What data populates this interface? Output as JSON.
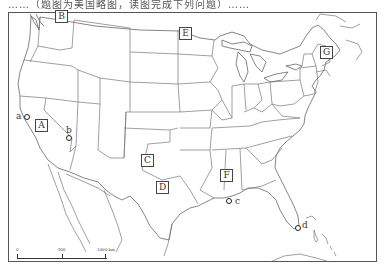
{
  "caption": {
    "text": "……（题图为美国略图，读图完成下列问题）……"
  },
  "map": {
    "title": "United States outline map (contiguous states)",
    "region_labels": [
      {
        "id": "A",
        "label": "A",
        "x": 35,
        "y": 119
      },
      {
        "id": "B",
        "label": "B",
        "x": 55,
        "y": 10
      },
      {
        "id": "C",
        "label": "C",
        "x": 141,
        "y": 154
      },
      {
        "id": "D",
        "label": "D",
        "x": 156,
        "y": 181
      },
      {
        "id": "E",
        "label": "E",
        "x": 179,
        "y": 27
      },
      {
        "id": "F",
        "label": "F",
        "x": 220,
        "y": 169
      },
      {
        "id": "G",
        "label": "G",
        "x": 320,
        "y": 46
      }
    ],
    "points": [
      {
        "id": "a",
        "label": "a",
        "x": 24,
        "y": 114,
        "lx": 16,
        "ly": 112
      },
      {
        "id": "b",
        "label": "b",
        "x": 66,
        "y": 135,
        "lx": 66,
        "ly": 126
      },
      {
        "id": "c",
        "label": "c",
        "x": 226,
        "y": 198,
        "lx": 235,
        "ly": 197
      },
      {
        "id": "d",
        "label": "d",
        "x": 295,
        "y": 225,
        "lx": 302,
        "ly": 221
      }
    ]
  },
  "scale_bar": {
    "labels": [
      "0",
      "500",
      "1000 km"
    ],
    "positions": [
      0,
      45,
      88
    ]
  },
  "colors": {
    "line": "#555555",
    "background": "#ffffff"
  }
}
